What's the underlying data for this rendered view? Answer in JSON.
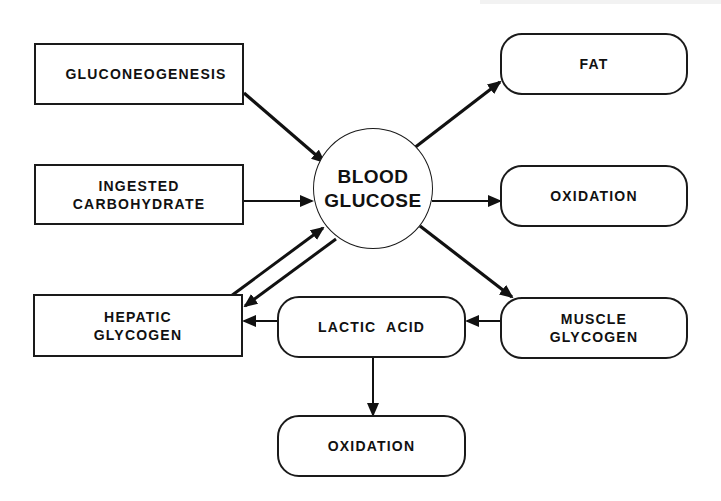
{
  "diagram": {
    "title": "",
    "center": {
      "id": "blood_glucose",
      "label": "BLOOD\nGLUCOSE"
    },
    "nodes": [
      {
        "id": "gluconeogenesis",
        "label": "GLUCONEOGENESIS",
        "shape": "rect"
      },
      {
        "id": "ingested_carbohydrate",
        "label": "INGESTED\nCARBOHYDRATE",
        "shape": "rect"
      },
      {
        "id": "hepatic_glycogen",
        "label": "HEPATIC\nGLYCOGEN",
        "shape": "rect"
      },
      {
        "id": "fat",
        "label": "FAT",
        "shape": "rounded"
      },
      {
        "id": "oxidation_right",
        "label": "OXIDATION",
        "shape": "rounded"
      },
      {
        "id": "muscle_glycogen",
        "label": "MUSCLE\nGLYCOGEN",
        "shape": "rounded"
      },
      {
        "id": "lactic_acid",
        "label": "LACTIC  ACID",
        "shape": "rounded"
      },
      {
        "id": "oxidation_bottom",
        "label": "OXIDATION",
        "shape": "rounded"
      }
    ],
    "edges": [
      {
        "from": "gluconeogenesis",
        "to": "blood_glucose"
      },
      {
        "from": "ingested_carbohydrate",
        "to": "blood_glucose"
      },
      {
        "from": "hepatic_glycogen",
        "to": "blood_glucose"
      },
      {
        "from": "blood_glucose",
        "to": "hepatic_glycogen"
      },
      {
        "from": "blood_glucose",
        "to": "fat"
      },
      {
        "from": "blood_glucose",
        "to": "oxidation_right"
      },
      {
        "from": "blood_glucose",
        "to": "muscle_glycogen"
      },
      {
        "from": "muscle_glycogen",
        "to": "lactic_acid"
      },
      {
        "from": "lactic_acid",
        "to": "hepatic_glycogen"
      },
      {
        "from": "lactic_acid",
        "to": "oxidation_bottom"
      }
    ],
    "colors": {
      "stroke": "#1a1a1a",
      "background": "#ffffff"
    }
  }
}
